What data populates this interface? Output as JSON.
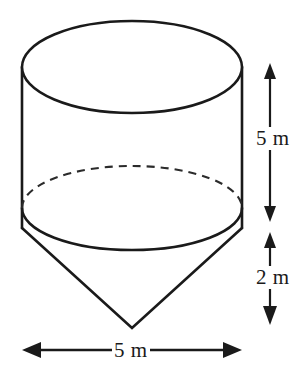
{
  "figure": {
    "shape_names": {
      "cylinder": "cylinder-body",
      "cone": "cone-bottom",
      "top_face": "cylinder-top-ellipse",
      "hidden_edge": "cylinder-bottom-hidden-arc"
    },
    "stroke_color": "#1a1a1a",
    "fill_color": "#ffffff",
    "background_color": "#ffffff"
  },
  "dimensions": {
    "cylinder_height": "5 m",
    "cone_height": "2 m",
    "diameter": "5 m"
  },
  "geometry": {
    "top_ellipse": {
      "cx": 132,
      "cy": 67,
      "rx": 110,
      "ry": 46
    },
    "bottom_ellipse": {
      "cx": 132,
      "cy": 208,
      "rx": 110,
      "ry": 42
    },
    "cylinder_left_x": 22,
    "cylinder_right_x": 242,
    "cylinder_top_y": 67,
    "cylinder_bottom_y": 228,
    "cone_apex": {
      "x": 132,
      "y": 328
    },
    "vertical_dim_x": 270,
    "vertical_dim_top_y": 63,
    "vertical_dim_mid_down_y": 222,
    "vertical_dim_mid_up_y": 232,
    "vertical_dim_bottom_y": 325,
    "horizontal_dim_y": 350,
    "horizontal_dim_left_x": 22,
    "horizontal_dim_right_x": 242
  }
}
